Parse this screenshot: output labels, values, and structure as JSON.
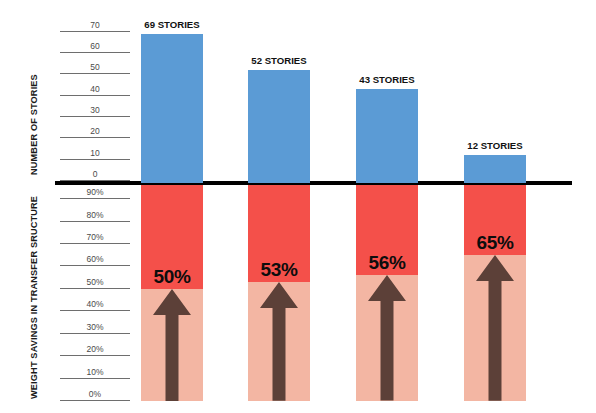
{
  "chart_data": {
    "type": "bar",
    "title": "",
    "orientation": "dual-axis-mirrored",
    "categories": [
      "Building 1",
      "Building 2",
      "Building 3",
      "Building 4"
    ],
    "series": [
      {
        "name": "NUMBER OF STORIES",
        "axis": "top",
        "unit": "stories",
        "values": [
          69,
          52,
          43,
          12
        ],
        "labels": [
          "69 STORIES",
          "52 STORIES",
          "43 STORIES",
          "12 STORIES"
        ],
        "color": "#5b9bd5",
        "ylim": [
          0,
          75
        ],
        "ticks": [
          70,
          60,
          50,
          40,
          30,
          20,
          10,
          0
        ],
        "direction": "up-from-baseline"
      },
      {
        "name": "WEIGHT SAVINGS IN TRANSFER SRUCTURE",
        "axis": "bottom",
        "unit": "percent",
        "values": [
          50,
          53,
          56,
          65
        ],
        "labels": [
          "50%",
          "53%",
          "56%",
          "65%"
        ],
        "color_high": "#f4504a",
        "color_low": "#f3b6a3",
        "ylim": [
          0,
          95
        ],
        "ticks": [
          "90%",
          "80%",
          "70%",
          "60%",
          "50%",
          "40%",
          "30%",
          "20%",
          "10%",
          "0%"
        ],
        "direction": "down-from-baseline"
      }
    ],
    "grid": true,
    "legend": false,
    "xlabel": "",
    "ylabel_top": "NUMBER OF STORIES",
    "ylabel_bottom": "WEIGHT SAVINGS IN TRANSFER SRUCTURE"
  },
  "axes": {
    "top": {
      "title": "NUMBER OF STORIES",
      "ticks": [
        {
          "value": 70,
          "label": "70"
        },
        {
          "value": 60,
          "label": "60"
        },
        {
          "value": 50,
          "label": "50"
        },
        {
          "value": 40,
          "label": "40"
        },
        {
          "value": 30,
          "label": "30"
        },
        {
          "value": 20,
          "label": "20"
        },
        {
          "value": 10,
          "label": "10"
        },
        {
          "value": 0,
          "label": "0"
        }
      ]
    },
    "bottom": {
      "title": "WEIGHT SAVINGS IN TRANSFER SRUCTURE",
      "ticks": [
        {
          "value": 90,
          "label": "90%"
        },
        {
          "value": 80,
          "label": "80%"
        },
        {
          "value": 70,
          "label": "70%"
        },
        {
          "value": 60,
          "label": "60%"
        },
        {
          "value": 50,
          "label": "50%"
        },
        {
          "value": 40,
          "label": "40%"
        },
        {
          "value": 30,
          "label": "30%"
        },
        {
          "value": 20,
          "label": "20%"
        },
        {
          "value": 10,
          "label": "10%"
        },
        {
          "value": 0,
          "label": "0%"
        }
      ]
    }
  },
  "bars": [
    {
      "stories_label": "69 STORIES",
      "stories_value": 69,
      "pct_label": "50%",
      "pct_value": 50
    },
    {
      "stories_label": "52 STORIES",
      "stories_value": 52,
      "pct_label": "53%",
      "pct_value": 53
    },
    {
      "stories_label": "43 STORIES",
      "stories_value": 43,
      "pct_label": "56%",
      "pct_value": 56
    },
    {
      "stories_label": "12 STORIES",
      "stories_value": 12,
      "pct_label": "65%",
      "pct_value": 65
    }
  ],
  "colors": {
    "bar_blue": "#5b9bd5",
    "bar_red_top": "#f4504a",
    "bar_red_bottom": "#f3b6a3",
    "arrow": "#5c4038",
    "baseline": "#000000",
    "grid": "#6e6e6e",
    "text": "#1a1a1a"
  }
}
